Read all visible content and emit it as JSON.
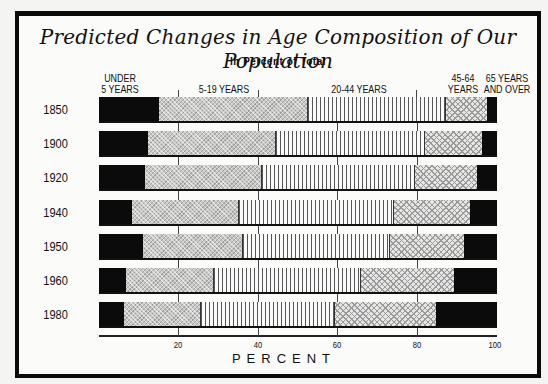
{
  "chart_data": {
    "type": "bar",
    "orientation": "horizontal",
    "stacked": true,
    "title": "Predicted Changes in Age Composition of Our Population",
    "subtitle": "In Percent of Total",
    "xlabel": "PERCENT",
    "ylabel": "",
    "xlim": [
      0,
      100
    ],
    "xticks": [
      20,
      40,
      60,
      80,
      100
    ],
    "grid": false,
    "categories": [
      "1850",
      "1900",
      "1920",
      "1940",
      "1950",
      "1960",
      "1980"
    ],
    "legend_position": "top (labels above segments)",
    "series": [
      {
        "name": "UNDER 5 YEARS",
        "pattern": "solid black",
        "values": [
          15.0,
          12.2,
          11.5,
          8.3,
          11.0,
          6.8,
          6.3
        ]
      },
      {
        "name": "5-19 YEARS",
        "pattern": "fine gray crosshatch",
        "values": [
          37.4,
          32.4,
          29.4,
          26.8,
          25.3,
          22.0,
          19.3
        ]
      },
      {
        "name": "20-44 YEARS",
        "pattern": "vertical lines",
        "values": [
          34.8,
          37.4,
          38.5,
          39.1,
          36.9,
          37.1,
          33.8
        ]
      },
      {
        "name": "45-64 YEARS",
        "pattern": "checkered dots",
        "values": [
          10.3,
          14.2,
          15.6,
          19.0,
          18.5,
          23.3,
          25.3
        ]
      },
      {
        "name": "65 YEARS AND OVER",
        "pattern": "solid black",
        "values": [
          2.5,
          3.8,
          5.0,
          6.8,
          8.3,
          10.8,
          15.3
        ]
      }
    ]
  },
  "labels": {
    "title": "Predicted Changes in Age Composition of Our Population",
    "subtitle": "In Percent of Total",
    "cat0_line1": "UNDER",
    "cat0_line2": "5 YEARS",
    "cat1": "5-19 YEARS",
    "cat2": "20-44 YEARS",
    "cat3_line1": "45-64",
    "cat3_line2": "YEARS",
    "cat4_line1": "65 YEARS",
    "cat4_line2": "AND OVER",
    "xlabel": "PERCENT",
    "ticks": [
      "20",
      "40",
      "60",
      "80",
      "100"
    ]
  }
}
